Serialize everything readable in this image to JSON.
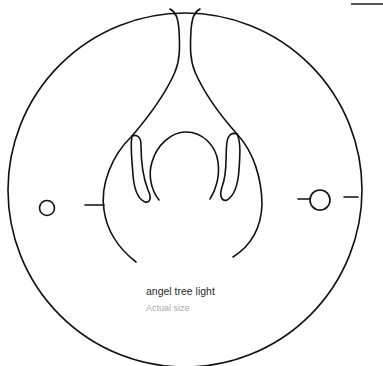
{
  "diagram": {
    "title": "angel tree light",
    "subtitle": "Actual size",
    "stroke_color": "#111111",
    "title_color": "#2a2a2a",
    "subtitle_color": "#a8a8a8",
    "background": "#ffffff"
  }
}
